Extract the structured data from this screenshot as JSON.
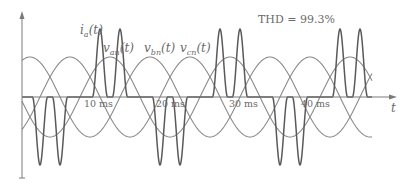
{
  "chart_data": {
    "type": "line",
    "title": "",
    "annotation": "THD = 99.3%",
    "xlabel": "t",
    "ylabel": "",
    "x_unit": "ms",
    "x_ticks": [
      10,
      20,
      30,
      40
    ],
    "x_tick_labels": [
      "10 ms",
      "20 ms",
      "30 ms",
      "40 ms"
    ],
    "xlim": [
      0,
      52
    ],
    "ylim": [
      -1.7,
      1.7
    ],
    "grid": false,
    "legend": "inline labels",
    "fundamental_frequency_hz": 60,
    "series": [
      {
        "name": "v_an(t)",
        "label_main": "v",
        "label_sub": "an",
        "kind": "sine",
        "amplitude": 1.0,
        "phase_deg": 0
      },
      {
        "name": "v_bn(t)",
        "label_main": "v",
        "label_sub": "bn",
        "kind": "sine",
        "amplitude": 1.0,
        "phase_deg": -120
      },
      {
        "name": "v_cn(t)",
        "label_main": "v",
        "label_sub": "cn",
        "kind": "sine",
        "amplitude": 1.0,
        "phase_deg": 120
      },
      {
        "name": "i_a(t)",
        "label_main": "i",
        "label_sub": "a",
        "kind": "double-pulse current",
        "peak": 1.7,
        "description": "Two narrow pulses per half-cycle near the peak of v_an; positive during positive half-cycle, negative during negative half-cycle"
      }
    ]
  },
  "labels": {
    "ia": {
      "main": "i",
      "sub": "a",
      "arg": "(t)"
    },
    "van": {
      "main": "v",
      "sub": "an",
      "arg": "(t)"
    },
    "vbn": {
      "main": "v",
      "sub": "bn",
      "arg": "(t)"
    },
    "vcn": {
      "main": "v",
      "sub": "cn",
      "arg": "(t)"
    },
    "thd": "THD = 99.3%",
    "t_axis": "t",
    "ticks": [
      "10 ms",
      "20 ms",
      "30 ms",
      "40 ms"
    ]
  },
  "colors": {
    "voltage": "#8a8a8a",
    "current": "#5a5a5a",
    "axis": "#7a7a7a",
    "text": "#6a6a6a"
  }
}
